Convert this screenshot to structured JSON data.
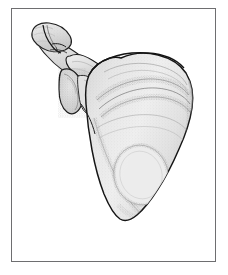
{
  "figure": {
    "title": "Scapula with lateral clavicle and acromioclavicular joint",
    "subject": "scapula",
    "view": "posterior oblique",
    "style": "stippled grayscale anatomical line drawing",
    "caption": "",
    "labels": [],
    "frame": {
      "border_color": "#6e6e70",
      "border_width_px": 1,
      "left": 11,
      "top": 8,
      "width": 205,
      "height": 254
    },
    "palette": {
      "background": "#ffffff",
      "page": "#ffffff",
      "outline": "#1a1a1a",
      "bone_fill_light": "#f2f2f2",
      "bone_fill": "#e8e8e8",
      "bone_fill_mid": "#dcdcdc",
      "bone_fill_dark": "#c9c9c9",
      "stipple": "#8a8a8a",
      "stipple_dark": "#5f5f5f",
      "shadow": "#b5b5b5",
      "frame": "#6e6e70"
    },
    "structures": [
      {
        "name": "clavicle-lateral-end",
        "description": "Lateral (acromial) end of the clavicle, upper left"
      },
      {
        "name": "acromioclavicular-joint",
        "description": "Articulation between clavicle and acromion"
      },
      {
        "name": "acromion",
        "description": "Acromion process projecting laterally"
      },
      {
        "name": "coracoid-process",
        "description": "Coracoid process, hook-shaped anterior projection"
      },
      {
        "name": "glenoid-cavity",
        "description": "Glenoid fossa seen in profile on the lateral angle"
      },
      {
        "name": "spine-of-scapula",
        "description": "Prominent ridge crossing the posterior body"
      },
      {
        "name": "supraspinous-fossa",
        "description": "Shallow fossa above the spine"
      },
      {
        "name": "infraspinous-fossa",
        "description": "Large fossa below the spine"
      },
      {
        "name": "medial-border",
        "description": "Vertebral (medial) border on the right of the drawing"
      },
      {
        "name": "lateral-border",
        "description": "Axillary (lateral) border descending on the left"
      },
      {
        "name": "inferior-angle",
        "description": "Inferior angle at the lower tip of the body"
      },
      {
        "name": "subscapular-impression",
        "description": "Oval impression in the lower body"
      }
    ]
  }
}
